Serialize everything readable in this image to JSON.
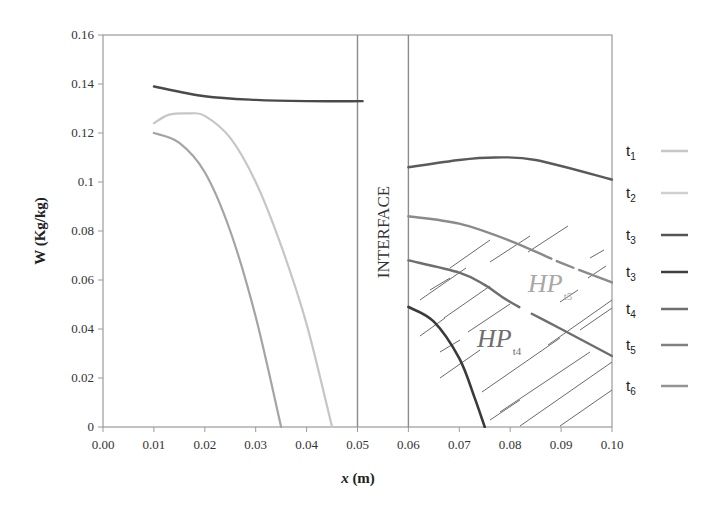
{
  "chart_data": {
    "type": "line",
    "title": "",
    "xlabel": "x (m)",
    "ylabel": "W (Kg/kg)",
    "xlim": [
      0.0,
      0.1
    ],
    "ylim": [
      0.0,
      0.16
    ],
    "grid": false,
    "legend_position": "right",
    "x_ticks": [
      "0.00",
      "0.01",
      "0.02",
      "0.03",
      "0.04",
      "0.05",
      "0.06",
      "0.07",
      "0.08",
      "0.09",
      "0.10"
    ],
    "y_ticks": [
      "0",
      "0.02",
      "0.04",
      "0.06",
      "0.08",
      "0.1",
      "0.12",
      "0.14",
      "0.16"
    ],
    "annotations": [
      {
        "text": "INTERFACE",
        "region_x": [
          0.05,
          0.06
        ],
        "orientation": "vertical"
      },
      {
        "text": "HP",
        "subscript": "t5",
        "x": 0.083,
        "y": 0.066,
        "color": "#a8a8a8"
      },
      {
        "text": "HP",
        "subscript": "t4",
        "x": 0.0745,
        "y": 0.041,
        "color": "#6e6e6e"
      }
    ],
    "hatched_regions": [
      {
        "between": [
          "t5_right",
          "t4_dark_right"
        ],
        "x_range": [
          0.06,
          0.1
        ]
      }
    ],
    "series": [
      {
        "name": "t1",
        "id": "t1_left",
        "color": "#c6c6c6",
        "width": 2.2,
        "x": [
          0.01,
          0.013,
          0.017,
          0.02,
          0.025,
          0.03,
          0.035,
          0.04,
          0.045
        ],
        "y": [
          0.124,
          0.1275,
          0.128,
          0.127,
          0.118,
          0.1,
          0.074,
          0.042,
          0.0
        ]
      },
      {
        "name": "t2",
        "id": "t2_left",
        "color": "#a4a4a4",
        "width": 2.2,
        "x": [
          0.01,
          0.015,
          0.02,
          0.025,
          0.03,
          0.035
        ],
        "y": [
          0.12,
          0.116,
          0.104,
          0.08,
          0.045,
          0.0
        ]
      },
      {
        "name": "t3",
        "id": "t3_left",
        "color": "#4a4a4a",
        "width": 2.4,
        "x": [
          0.01,
          0.02,
          0.03,
          0.04,
          0.051
        ],
        "y": [
          0.139,
          0.135,
          0.1335,
          0.133,
          0.133
        ]
      },
      {
        "name": "t3",
        "id": "t3_right",
        "color": "#5a5a5a",
        "width": 2.4,
        "x": [
          0.06,
          0.07,
          0.077,
          0.085,
          0.1
        ],
        "y": [
          0.106,
          0.109,
          0.11,
          0.109,
          0.101
        ]
      },
      {
        "name": "t5",
        "id": "t5_right",
        "color": "#8a8a8a",
        "width": 2.4,
        "x": [
          0.06,
          0.07,
          0.08,
          0.09,
          0.1
        ],
        "y": [
          0.086,
          0.083,
          0.076,
          0.067,
          0.059
        ]
      },
      {
        "name": "t6",
        "id": "t6_right",
        "color": "#6e6e6e",
        "width": 2.4,
        "x": [
          0.06,
          0.07,
          0.075,
          0.08,
          0.09,
          0.1
        ],
        "y": [
          0.068,
          0.063,
          0.058,
          0.051,
          0.04,
          0.029
        ]
      },
      {
        "name": "t4",
        "id": "t4_dark_right",
        "color": "#3a3a3a",
        "width": 2.6,
        "x": [
          0.06,
          0.065,
          0.07,
          0.073,
          0.075
        ],
        "y": [
          0.049,
          0.043,
          0.028,
          0.012,
          0.0
        ]
      }
    ],
    "legend": [
      {
        "label": "t",
        "sub": "1",
        "color": "#c6c6c6"
      },
      {
        "label": "t",
        "sub": "2",
        "color": "#d0d0d0"
      },
      {
        "label": "t",
        "sub": "3",
        "color": "#555555"
      },
      {
        "label": "t",
        "sub": "3",
        "color": "#3f3f3f"
      },
      {
        "label": "t",
        "sub": "4",
        "color": "#6e6e6e"
      },
      {
        "label": "t",
        "sub": "5",
        "color": "#808080"
      },
      {
        "label": "t",
        "sub": "6",
        "color": "#949494"
      }
    ]
  },
  "labels": {
    "xlabel_main": "x",
    "xlabel_unit": " (m)",
    "ylabel": "W (Kg/kg)",
    "interface": "INTERFACE",
    "hp": "HP",
    "hp_t5_sub": "t5",
    "hp_t4_sub": "t4"
  }
}
